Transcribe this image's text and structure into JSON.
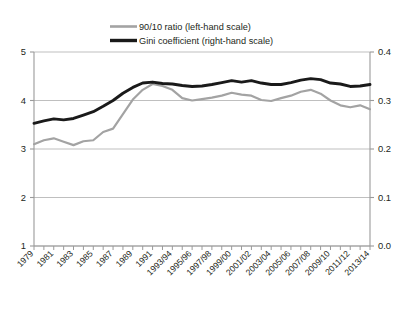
{
  "chart_data": {
    "type": "line",
    "title": "",
    "subtitle": "",
    "xlabel": "",
    "ylabel": "",
    "grid": true,
    "legend_position": "top-center",
    "left_axis": {
      "label": "90/10 ratio (left-hand scale)",
      "ticks": [
        "1",
        "2",
        "3",
        "4",
        "5"
      ],
      "ylim": [
        1,
        5
      ]
    },
    "right_axis": {
      "label": "Gini coefficient (right-hand scale)",
      "ticks": [
        "0.0",
        "0.1",
        "0.2",
        "0.3",
        "0.4"
      ],
      "ylim": [
        0.0,
        0.4
      ]
    },
    "x": [
      "1979",
      "1980",
      "1981",
      "1982",
      "1983",
      "1984",
      "1985",
      "1986",
      "1987",
      "1988",
      "1989",
      "1990",
      "1991",
      "1992",
      "1993/94",
      "1994/95",
      "1995/96",
      "1996/97",
      "1997/98",
      "1998/99",
      "1999/00",
      "2000/01",
      "2001/02",
      "2002/03",
      "2003/04",
      "2004/05",
      "2005/06",
      "2006/07",
      "2007/08",
      "2008/09",
      "2009/10",
      "2010/11",
      "2011/12",
      "2012/13",
      "2013/14"
    ],
    "xtick_labels": [
      "1979",
      "1981",
      "1983",
      "1985",
      "1987",
      "1989",
      "1991",
      "1993/94",
      "1995/96",
      "1997/98",
      "1999/00",
      "2001/02",
      "2003/04",
      "2005/06",
      "2007/08",
      "2009/10",
      "2011/12",
      "2013/14"
    ],
    "series": [
      {
        "name": "90/10 ratio (left-hand scale)",
        "axis": "left",
        "color": "#a3a3a3",
        "values": [
          3.1,
          3.18,
          3.22,
          3.15,
          3.08,
          3.16,
          3.18,
          3.35,
          3.42,
          3.72,
          4.02,
          4.22,
          4.34,
          4.3,
          4.22,
          4.05,
          4.0,
          4.03,
          4.06,
          4.1,
          4.16,
          4.12,
          4.1,
          4.01,
          3.99,
          4.05,
          4.1,
          4.18,
          4.22,
          4.14,
          4.0,
          3.9,
          3.86,
          3.9,
          3.82
        ]
      },
      {
        "name": "Gini coefficient (right-hand scale)",
        "axis": "right",
        "color": "#1a1a1a",
        "values": [
          0.253,
          0.258,
          0.262,
          0.26,
          0.263,
          0.27,
          0.277,
          0.288,
          0.3,
          0.315,
          0.327,
          0.336,
          0.338,
          0.335,
          0.334,
          0.331,
          0.329,
          0.33,
          0.333,
          0.337,
          0.341,
          0.338,
          0.341,
          0.336,
          0.333,
          0.333,
          0.337,
          0.342,
          0.345,
          0.343,
          0.336,
          0.334,
          0.329,
          0.33,
          0.333
        ]
      }
    ]
  }
}
